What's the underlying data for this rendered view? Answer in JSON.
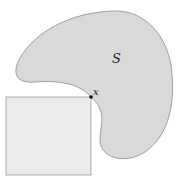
{
  "diagram": {
    "set_label": "S",
    "point_label": "x",
    "colors": {
      "set_fill": "#d9d9d9",
      "set_stroke": "#8a8a8a",
      "square_fill": "#ececec",
      "square_stroke": "#9a9a9a",
      "point": "#111111"
    }
  }
}
